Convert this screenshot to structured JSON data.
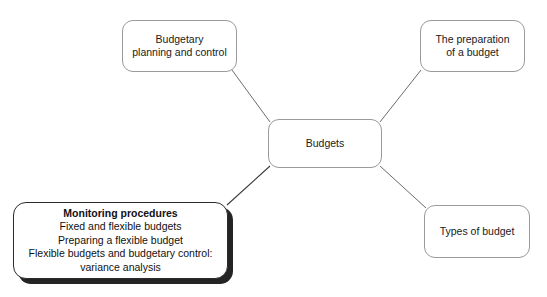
{
  "diagram": {
    "type": "mind-map",
    "background_color": "#ffffff",
    "center": {
      "label": "Budgets",
      "x": 268,
      "y": 119,
      "w": 114,
      "h": 49
    },
    "nodes": [
      {
        "name": "budgetary-planning-and-control",
        "label": "Budgetary\nplanning and control",
        "x": 122,
        "y": 20,
        "w": 115,
        "h": 52
      },
      {
        "name": "the-preparation-of-a-budget",
        "label": "The preparation\nof a budget",
        "x": 420,
        "y": 20,
        "w": 105,
        "h": 52
      },
      {
        "name": "types-of-budget",
        "label": "Types of budget",
        "x": 424,
        "y": 205,
        "w": 106,
        "h": 53
      }
    ],
    "highlighted_node": {
      "name": "monitoring-procedures",
      "title": "Monitoring procedures",
      "lines": [
        "Fixed and flexible budgets",
        "Preparing a flexible budget",
        "Flexible budgets and budgetary control:\nvariance analysis"
      ],
      "x": 13,
      "y": 202,
      "w": 215,
      "h": 77,
      "border_color": "#2b2b2b",
      "shadow_color": "#242424"
    },
    "connectors": [
      {
        "name": "connector-center-to-budgetary-planning",
        "x1": 270,
        "y1": 122,
        "x2": 232,
        "y2": 70,
        "color": "#5a5a5a"
      },
      {
        "name": "connector-center-to-preparation",
        "x1": 380,
        "y1": 122,
        "x2": 421,
        "y2": 70,
        "color": "#5a5a5a"
      },
      {
        "name": "connector-center-to-types-of-budget",
        "x1": 380,
        "y1": 166,
        "x2": 426,
        "y2": 208,
        "color": "#5a5a5a"
      },
      {
        "name": "connector-center-to-monitoring-procedures",
        "x1": 270,
        "y1": 166,
        "x2": 227,
        "y2": 205,
        "color": "#3a3a3a"
      }
    ]
  }
}
